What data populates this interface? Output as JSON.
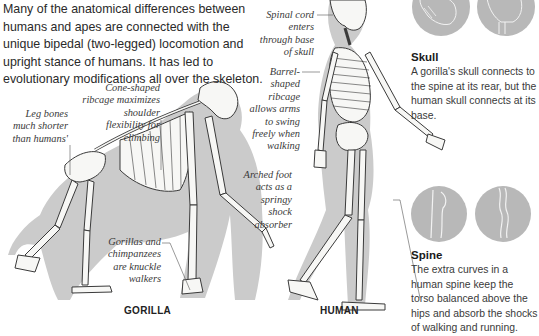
{
  "intro": {
    "text": "Many of the anatomical differences between humans and apes are connected with the unique bipedal (two-legged) locomotion and upright stance of humans. It has led to evolutionary modifications all over the skeleton."
  },
  "labels": {
    "cone_ribcage": "Cone-shaped ribcage maximizes shoulder flexibility for climbing",
    "leg_bones": "Leg bones much shorter than humans'",
    "knuckle_walkers": "Gorillas and chimpanzees are knuckle walkers",
    "spinal_cord": "Spinal cord enters through base of skull",
    "barrel_ribcage": "Barrel-shaped ribcage allows arms to swing freely when walking",
    "arched_foot": "Arched foot acts as a springy shock absorber"
  },
  "captions": {
    "gorilla": "GORILLA",
    "human": "HUMAN"
  },
  "panels": {
    "skull": {
      "title": "Skull",
      "text": "A gorilla's skull connects to the spine at its rear, but the human skull connects at its base."
    },
    "spine": {
      "title": "Spine",
      "text": "The extra curves in a human spine keep the torso balanced above the hips and absorb the shocks of walking and running."
    }
  },
  "colors": {
    "shadow": "#c9c9c9",
    "bone": "#f7f7f5",
    "outline": "#3a3a3a",
    "disc": "#b8b8b8"
  }
}
